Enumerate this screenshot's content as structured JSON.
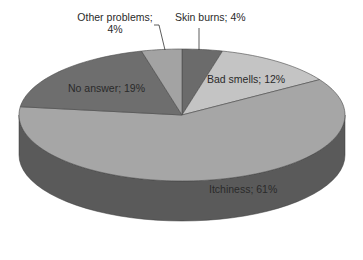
{
  "chart_data": {
    "type": "pie",
    "style": "3d",
    "title": "",
    "start_angle_deg": 0,
    "direction": "clockwise",
    "slices": [
      {
        "label": "Skin burns",
        "value": 4,
        "display": "Skin burns; 4%",
        "color": "#6b6b6b"
      },
      {
        "label": "Bad smells",
        "value": 12,
        "display": "Bad smells; 12%",
        "color": "#c4c4c4"
      },
      {
        "label": "Itchiness",
        "value": 61,
        "display": "Itchiness; 61%",
        "color": "#a6a6a6"
      },
      {
        "label": "No answer",
        "value": 19,
        "display": "No answer; 19%",
        "color": "#6e6e6e"
      },
      {
        "label": "Other problems",
        "value": 4,
        "display_line1": "Other problems;",
        "display_line2": "4%",
        "color": "#a3a3a3"
      }
    ],
    "side_colors": {
      "Itchiness": "#5a5a5a",
      "No answer": "#4a4a4a"
    },
    "legend": "none"
  }
}
